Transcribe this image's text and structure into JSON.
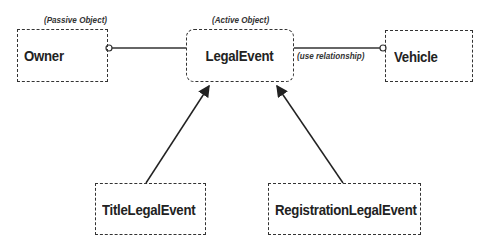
{
  "diagram": {
    "nodes": {
      "owner": {
        "label": "Owner",
        "stereotype": "(Passive Object)"
      },
      "legal_event": {
        "label": "LegalEvent",
        "stereotype": "(Active Object)"
      },
      "vehicle": {
        "label": "Vehicle"
      },
      "title_legal_event": {
        "label": "TitleLegalEvent"
      },
      "registration_legal_event": {
        "label": "RegistrationLegalEvent"
      }
    },
    "edges": {
      "owner_legal_event": {
        "from": "Owner",
        "to": "LegalEvent",
        "type": "association"
      },
      "legal_event_vehicle": {
        "from": "LegalEvent",
        "to": "Vehicle",
        "type": "use",
        "label": "(use relationship)"
      },
      "title_inherits": {
        "from": "TitleLegalEvent",
        "to": "LegalEvent",
        "type": "inheritance"
      },
      "registration_inherits": {
        "from": "RegistrationLegalEvent",
        "to": "LegalEvent",
        "type": "inheritance"
      }
    },
    "colors": {
      "line": "#333333",
      "text": "#222222",
      "background": "#ffffff"
    }
  }
}
